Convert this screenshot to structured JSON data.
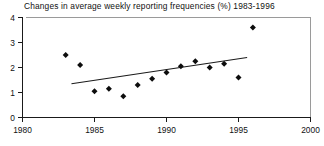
{
  "chart_data": {
    "type": "scatter",
    "title": "Changes in average weekly reporting frequencies (%) 1983-1996",
    "xlabel": "",
    "ylabel": "",
    "xlim": [
      1980,
      2000
    ],
    "ylim": [
      0,
      4
    ],
    "grid": false,
    "legend": "none",
    "xticks": [
      1980,
      1985,
      1990,
      1995,
      2000
    ],
    "xtick_labels": [
      "1980",
      "1985",
      "1990",
      "1995",
      "2000"
    ],
    "yticks": [
      0,
      1,
      2,
      3,
      4
    ],
    "ytick_labels": [
      "0",
      "1",
      "2",
      "3",
      "4"
    ],
    "marker": "diamond",
    "marker_color": "#0d0d0d",
    "points": [
      {
        "x": 1983.0,
        "y": 2.5
      },
      {
        "x": 1984.0,
        "y": 2.1
      },
      {
        "x": 1985.0,
        "y": 1.05
      },
      {
        "x": 1986.0,
        "y": 1.15
      },
      {
        "x": 1987.0,
        "y": 0.85
      },
      {
        "x": 1988.0,
        "y": 1.3
      },
      {
        "x": 1989.0,
        "y": 1.55
      },
      {
        "x": 1990.0,
        "y": 1.8
      },
      {
        "x": 1991.0,
        "y": 2.05
      },
      {
        "x": 1992.0,
        "y": 2.25
      },
      {
        "x": 1993.0,
        "y": 2.0
      },
      {
        "x": 1994.0,
        "y": 2.15
      },
      {
        "x": 1995.0,
        "y": 1.6
      },
      {
        "x": 1996.0,
        "y": 3.6
      }
    ],
    "series": [
      {
        "name": "Changes in average weekly reporting frequencies (%)",
        "x": [
          1983,
          1984,
          1985,
          1986,
          1987,
          1988,
          1989,
          1990,
          1991,
          1992,
          1993,
          1994,
          1995,
          1996
        ],
        "values": [
          2.5,
          2.1,
          1.05,
          1.15,
          0.85,
          1.3,
          1.55,
          1.8,
          2.05,
          2.25,
          2.0,
          2.15,
          1.6,
          3.6
        ]
      }
    ],
    "trend_line": {
      "name": "linear trend",
      "x_start": 1983.4,
      "y_start": 1.35,
      "x_end": 1995.6,
      "y_end": 2.4
    }
  }
}
